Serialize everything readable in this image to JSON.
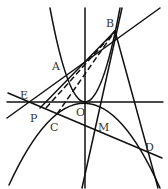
{
  "diagram": {
    "type": "geometry",
    "labels": {
      "A": "A",
      "B": "B",
      "E": "E",
      "P": "P",
      "O": "O",
      "C": "C",
      "M": "M",
      "D": "D"
    },
    "colors": {
      "stroke": "#111111",
      "text": "#333333",
      "background": "#ffffff"
    }
  }
}
